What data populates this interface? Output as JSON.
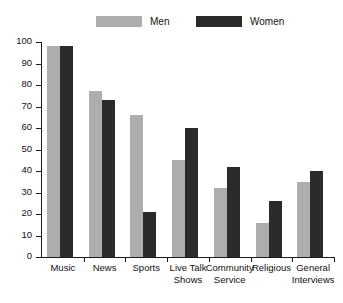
{
  "chart_data": {
    "type": "bar",
    "title": "",
    "xlabel": "",
    "ylabel": "",
    "ylim": [
      0,
      100
    ],
    "yticks": [
      0,
      10,
      20,
      30,
      40,
      50,
      60,
      70,
      80,
      90,
      100
    ],
    "grid": false,
    "legend_position": "top",
    "categories": [
      "Music",
      "News",
      "Sports",
      "Live Talk\nShows",
      "Community\nService",
      "Religious",
      "General\nInterviews"
    ],
    "series": [
      {
        "name": "Men",
        "color": "#adadad",
        "values": [
          98,
          77,
          66,
          45,
          32,
          16,
          35
        ]
      },
      {
        "name": "Women",
        "color": "#2b2b2b",
        "values": [
          98,
          73,
          21,
          60,
          42,
          26,
          40
        ]
      }
    ]
  },
  "legend": {
    "entries": [
      {
        "label": "Men",
        "color": "#adadad"
      },
      {
        "label": "Women",
        "color": "#2b2b2b"
      }
    ]
  },
  "axis": {
    "y_tick_labels": [
      "100",
      "90",
      "80",
      "70",
      "60",
      "50",
      "40",
      "30",
      "20",
      "10",
      "0"
    ]
  }
}
